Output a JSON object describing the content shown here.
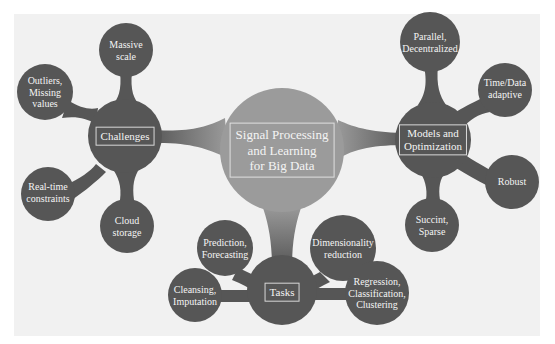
{
  "colors": {
    "background": "#f1f1f1",
    "node_dark": "#565656",
    "center_node": "#9b9b9b",
    "text": "#f4f4f4"
  },
  "center": {
    "lines": [
      "Signal Processing",
      "and Learning",
      "for Big Data"
    ]
  },
  "hubs": {
    "challenges": {
      "label": "Challenges",
      "children": [
        {
          "lines": [
            "Massive",
            "scale"
          ]
        },
        {
          "lines": [
            "Outliers,",
            "Missing",
            "values"
          ]
        },
        {
          "lines": [
            "Real-time",
            "constraints"
          ]
        },
        {
          "lines": [
            "Cloud",
            "storage"
          ]
        }
      ]
    },
    "models": {
      "lines": [
        "Models and",
        "Optimization"
      ],
      "children": [
        {
          "lines": [
            "Parallel,",
            "Decentralized"
          ]
        },
        {
          "lines": [
            "Time/Data",
            "adaptive"
          ]
        },
        {
          "lines": [
            "Robust"
          ]
        },
        {
          "lines": [
            "Succint,",
            "Sparse"
          ]
        }
      ]
    },
    "tasks": {
      "label": "Tasks",
      "children": [
        {
          "lines": [
            "Prediction,",
            "Forecasting"
          ]
        },
        {
          "lines": [
            "Dimensionality",
            "reduction"
          ]
        },
        {
          "lines": [
            "Cleansing,",
            "Imputation"
          ]
        },
        {
          "lines": [
            "Regression,",
            "Classification,",
            "Clustering"
          ]
        }
      ]
    }
  }
}
